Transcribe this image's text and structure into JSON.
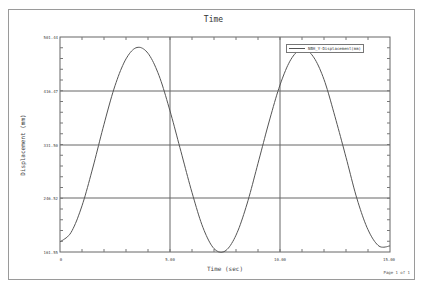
{
  "title": "Time",
  "xlabel": "Time (sec)",
  "ylabel": "Displacement (mm)",
  "page_label": "Page 1 of 1",
  "legend": {
    "entries": [
      {
        "label": "NBH_Y-Displacement(mm)"
      }
    ]
  },
  "y_ticks": [
    "501.44",
    "416.47",
    "331.50",
    "246.52",
    "161.55"
  ],
  "x_ticks": [
    "0",
    "5.00",
    "10.00",
    "15.00"
  ],
  "chart_data": {
    "type": "line",
    "title": "Time",
    "xlabel": "Time (sec)",
    "ylabel": "Displacement (mm)",
    "xlim": [
      0,
      15
    ],
    "ylim": [
      161.55,
      501.44
    ],
    "grid": true,
    "legend_position": "upper right",
    "x_tick_labels": [
      "0",
      "5.00",
      "10.00",
      "15.00"
    ],
    "y_tick_labels": [
      "161.55",
      "246.52",
      "331.50",
      "416.47",
      "501.44"
    ],
    "series": [
      {
        "name": "NBH_Y-Displacement(mm)",
        "x": [
          0,
          0.5,
          1.0,
          1.5,
          2.0,
          2.5,
          3.0,
          3.5,
          4.0,
          4.5,
          5.0,
          5.5,
          6.0,
          6.5,
          7.0,
          7.5,
          8.0,
          8.5,
          9.0,
          9.5,
          10.0,
          10.5,
          11.0,
          11.5,
          12.0,
          12.5,
          13.0,
          13.5,
          14.0,
          14.5,
          15.0
        ],
        "values": [
          177.6,
          192.4,
          234.6,
          295.9,
          363.5,
          424.4,
          466.8,
          484.9,
          475.6,
          440.5,
          384.6,
          320.1,
          255.6,
          200.1,
          167.0,
          163.0,
          188.1,
          237.5,
          301.7,
          367.0,
          425.5,
          466.2,
          482.0,
          471.0,
          434.3,
          375.5,
          311.3,
          245.6,
          196.8,
          170.9,
          171.2
        ]
      }
    ]
  }
}
